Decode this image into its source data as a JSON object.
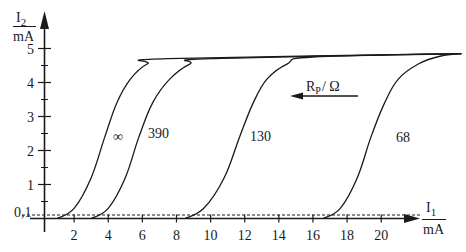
{
  "chart_data": {
    "type": "line",
    "title": "",
    "xlabel": "I1 / mA",
    "ylabel": "I2 / mA",
    "x_axis": {
      "symbol": "I",
      "subscript": "1",
      "unit": "mA",
      "ticks": [
        2,
        4,
        6,
        8,
        10,
        12,
        14,
        16,
        18,
        20
      ],
      "range": [
        0,
        24.7
      ]
    },
    "y_axis": {
      "symbol": "I",
      "subscript": "2",
      "unit": "mA",
      "ticks": [
        1,
        2,
        3,
        4,
        5
      ],
      "minor_ticks": [
        0.5,
        1.5,
        2.5,
        3.5,
        4.5
      ],
      "extra_label": "0,1",
      "range": [
        0,
        5.5
      ]
    },
    "reference_line": {
      "y": 0.1,
      "style": "dashed",
      "label": "0,1"
    },
    "grid": false,
    "legend": {
      "position": "annotation",
      "text_main": "R",
      "text_sub": "P",
      "text_unit": "/ Ω",
      "arrow_direction": "left"
    },
    "series": [
      {
        "name": "∞",
        "label": "∞",
        "points": [
          [
            1.0,
            0.0
          ],
          [
            2.0,
            0.3
          ],
          [
            3.0,
            1.2
          ],
          [
            3.8,
            2.4
          ],
          [
            4.5,
            3.4
          ],
          [
            5.3,
            4.1
          ],
          [
            6.3,
            4.55
          ],
          [
            7.5,
            4.7
          ],
          [
            24.7,
            4.85
          ]
        ]
      },
      {
        "name": "390",
        "label": "390",
        "points": [
          [
            3.0,
            0.0
          ],
          [
            4.0,
            0.3
          ],
          [
            5.0,
            1.2
          ],
          [
            5.8,
            2.4
          ],
          [
            6.6,
            3.4
          ],
          [
            7.6,
            4.1
          ],
          [
            8.8,
            4.55
          ],
          [
            10.0,
            4.7
          ],
          [
            24.7,
            4.85
          ]
        ]
      },
      {
        "name": "130",
        "label": "130",
        "points": [
          [
            8.5,
            0.0
          ],
          [
            9.6,
            0.3
          ],
          [
            10.8,
            1.2
          ],
          [
            11.7,
            2.4
          ],
          [
            12.5,
            3.4
          ],
          [
            13.3,
            4.1
          ],
          [
            14.5,
            4.55
          ],
          [
            16.0,
            4.75
          ],
          [
            24.7,
            4.85
          ]
        ]
      },
      {
        "name": "68",
        "label": "68",
        "points": [
          [
            16.6,
            0.0
          ],
          [
            17.6,
            0.3
          ],
          [
            18.6,
            1.2
          ],
          [
            19.4,
            2.4
          ],
          [
            20.2,
            3.4
          ],
          [
            21.0,
            4.1
          ],
          [
            22.2,
            4.55
          ],
          [
            23.5,
            4.78
          ],
          [
            24.7,
            4.85
          ]
        ]
      }
    ]
  },
  "labels": {
    "y_symbol": "I",
    "y_sub": "2",
    "y_unit": "mA",
    "x_symbol": "I",
    "x_sub": "1",
    "x_unit": "mA",
    "ref_label": "0,1",
    "legend_main": "R",
    "legend_sub": "P",
    "legend_unit": "/ Ω",
    "curve_inf": "∞",
    "curve_390": "390",
    "curve_130": "130",
    "curve_68": "68"
  }
}
